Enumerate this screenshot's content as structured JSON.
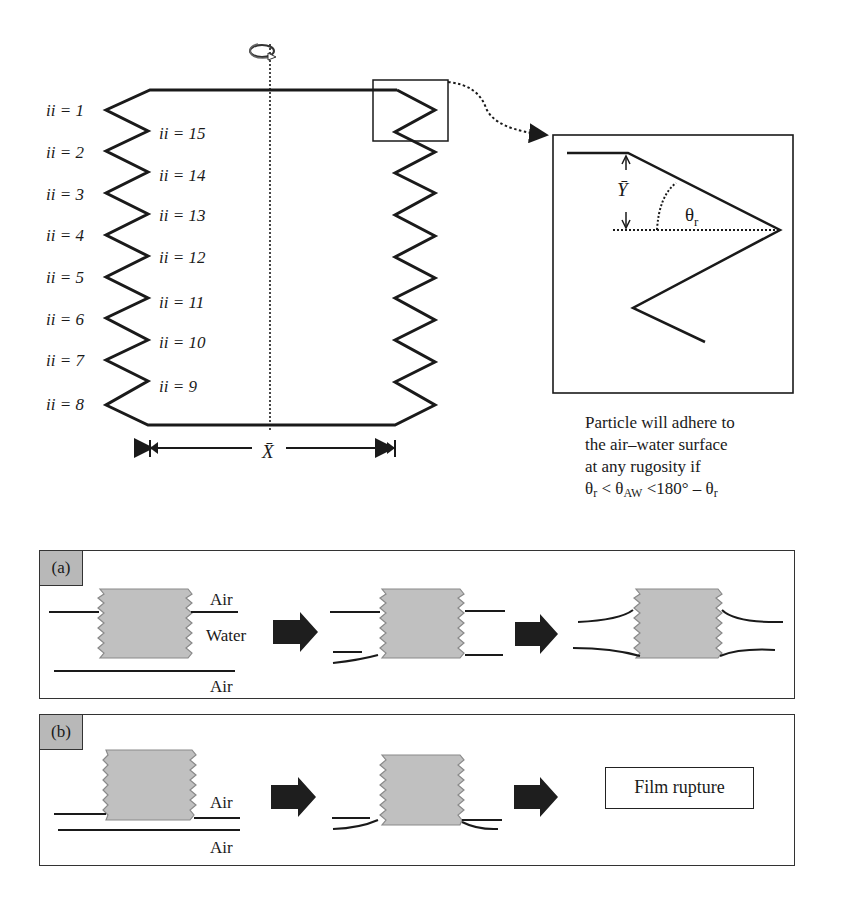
{
  "figure": {
    "top_diagram": {
      "left_labels": [
        "ii = 1",
        "ii = 2",
        "ii = 3",
        "ii = 4",
        "ii = 5",
        "ii = 6",
        "ii = 7",
        "ii = 8"
      ],
      "inner_labels": [
        "ii = 15",
        "ii = 14",
        "ii = 13",
        "ii = 12",
        "ii = 11",
        "ii = 10",
        "ii = 9"
      ],
      "x_dimension_label": "X̄",
      "rotation_icon": "rotation-arrow-icon"
    },
    "zoom_inset": {
      "y_label": "Ȳ",
      "angle_label": "θ",
      "angle_sub": "r"
    },
    "caption": {
      "line1": "Particle will adhere to",
      "line2": "the air–water surface",
      "line3": "at any rugosity if",
      "cond_theta1": "θ",
      "cond_sub1": "r",
      "cond_lt": " < θ",
      "cond_sub2": "AW",
      "cond_mid": " <180° – θ",
      "cond_sub3": "r"
    },
    "panel_a": {
      "tag": "(a)",
      "air_top": "Air",
      "water": "Water",
      "air_bottom": "Air"
    },
    "panel_b": {
      "tag": "(b)",
      "air_top": "Air",
      "air_bottom": "Air",
      "result": "Film rupture"
    },
    "colors": {
      "line": "#1a1a1a",
      "block_fill": "#c0c0c0",
      "block_edge": "#8a8a8a",
      "tag_fill": "#b8b8b8",
      "arrow_fill": "#1e1e1e"
    }
  }
}
